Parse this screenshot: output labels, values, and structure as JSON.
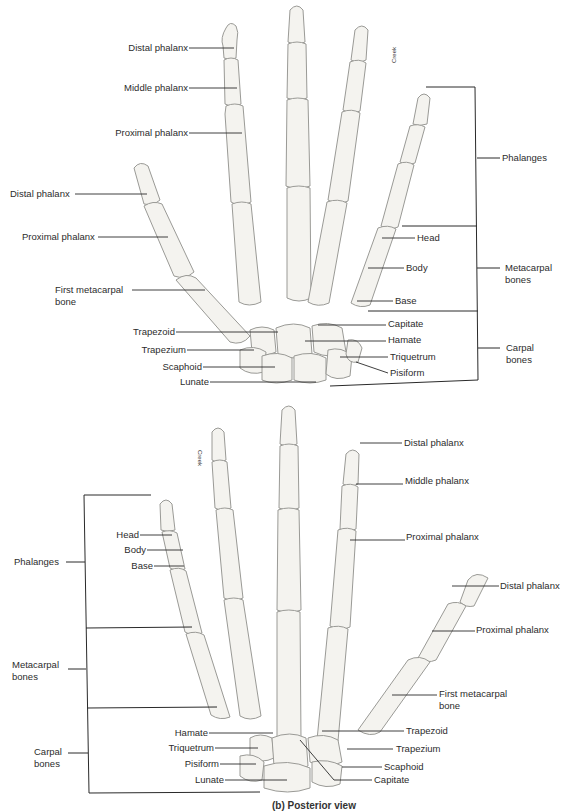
{
  "figure": {
    "artist_credit": "Creek",
    "caption_partial": "(b) Posterior view",
    "colors": {
      "background": "#ffffff",
      "bone_fill": "#f4f3ef",
      "bone_outline": "#9a9a96",
      "leader_line": "#2a2a2a",
      "label_text": "#2c2c2c"
    }
  },
  "top_view": {
    "labels": {
      "distal_phalanx_finger": "Distal phalanx",
      "middle_phalanx": "Middle phalanx",
      "proximal_phalanx_finger": "Proximal phalanx",
      "distal_phalanx_thumb": "Distal phalanx",
      "proximal_phalanx_thumb": "Proximal phalanx",
      "first_metacarpal_1": "First metacarpal",
      "first_metacarpal_2": "bone",
      "trapezoid": "Trapezoid",
      "trapezium": "Trapezium",
      "scaphoid": "Scaphoid",
      "lunate": "Lunate",
      "head": "Head",
      "body": "Body",
      "base": "Base",
      "capitate": "Capitate",
      "hamate": "Hamate",
      "triquetrum": "Triquetrum",
      "pisiform": "Pisiform"
    },
    "groups": {
      "phalanges": "Phalanges",
      "metacarpal_1": "Metacarpal",
      "metacarpal_2": "bones",
      "carpal_1": "Carpal",
      "carpal_2": "bones"
    }
  },
  "bottom_view": {
    "labels": {
      "distal_phalanx_finger": "Distal phalanx",
      "middle_phalanx": "Middle phalanx",
      "proximal_phalanx_finger": "Proximal phalanx",
      "distal_phalanx_thumb": "Distal phalanx",
      "proximal_phalanx_thumb": "Proximal phalanx",
      "first_metacarpal_1": "First metacarpal",
      "first_metacarpal_2": "bone",
      "head": "Head",
      "body": "Body",
      "base": "Base",
      "hamate": "Hamate",
      "triquetrum": "Triquetrum",
      "pisiform": "Pisiform",
      "lunate": "Lunate",
      "trapezoid": "Trapezoid",
      "trapezium": "Trapezium",
      "scaphoid": "Scaphoid",
      "capitate": "Capitate"
    },
    "groups": {
      "phalanges": "Phalanges",
      "metacarpal_1": "Metacarpal",
      "metacarpal_2": "bones",
      "carpal_1": "Carpal",
      "carpal_2": "bones"
    }
  }
}
